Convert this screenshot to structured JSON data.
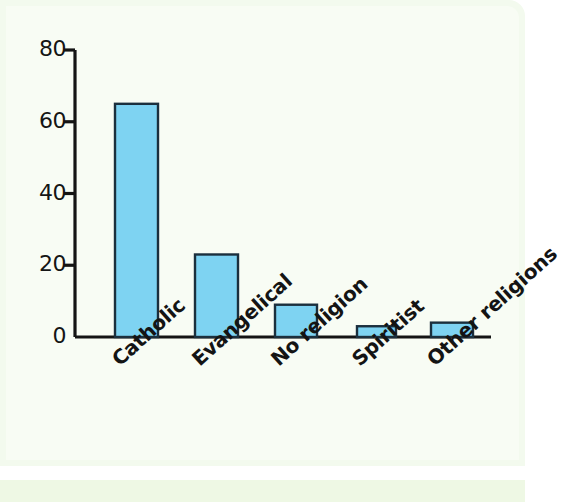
{
  "figure": {
    "panel_background": "#f3faee",
    "bottom_strip_color": "#eef8e4"
  },
  "chart_data": {
    "type": "bar",
    "title": "",
    "subtitle": "",
    "xlabel": "",
    "ylabel": "",
    "categories": [
      "Catholic",
      "Evangelical",
      "No religion",
      "Spiritist",
      "Other religions"
    ],
    "values": [
      65,
      23,
      9,
      3,
      4
    ],
    "series": [
      {
        "name": "Share of population (%)",
        "values": [
          65,
          23,
          9,
          3,
          4
        ]
      }
    ],
    "ylim": [
      0,
      80
    ],
    "y_ticks": [
      0,
      20,
      40,
      60,
      80
    ],
    "y_tick_labels": [
      "0",
      "20",
      "40",
      "60",
      "80"
    ],
    "x_tick_labels": [
      "Catholic",
      "Evangelical",
      "No religion",
      "Spiritist",
      "Other religions"
    ],
    "grid": false,
    "legend": false,
    "legend_position": "none",
    "bar_fill_color": "#7ed3f2",
    "bar_edge_color": "#1b2f3d",
    "axis_color": "#141414",
    "x_label_rotation_degrees": -42,
    "annotations": []
  }
}
